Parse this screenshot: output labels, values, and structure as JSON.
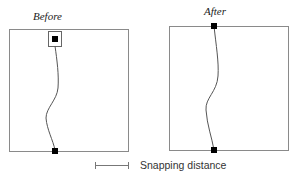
{
  "panels": [
    {
      "title": "Before",
      "frame": {
        "x": 9,
        "y": 29,
        "w": 119,
        "h": 122
      },
      "snap_box": {
        "x": 48,
        "y": 31,
        "w": 13,
        "h": 15
      },
      "node_top": {
        "x": 52,
        "y": 36,
        "size": 6
      },
      "node_bottom": {
        "x": 52,
        "y": 148,
        "size": 6
      },
      "curve": "M55,46 C57,60 59,75 58,88 C57,100 46,108 46,118 C47,130 53,140 55,150"
    },
    {
      "title": "After",
      "frame": {
        "x": 169,
        "y": 26,
        "w": 119,
        "h": 124
      },
      "node_top": {
        "x": 211,
        "y": 23,
        "size": 6
      },
      "node_bottom": {
        "x": 211,
        "y": 147,
        "size": 6
      },
      "curve": "M214,26 C216,45 219,62 218,76 C217,92 205,98 206,110 C207,125 212,138 214,150"
    }
  ],
  "legend": {
    "label": "Snapping distance",
    "bar": {
      "x1": 95,
      "x2": 128,
      "y": 165
    }
  },
  "colors": {
    "frame": "#8a8a8a",
    "curve": "#555555",
    "node": "#000000"
  }
}
